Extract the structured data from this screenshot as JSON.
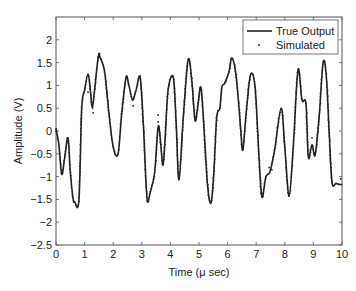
{
  "chart_data": {
    "type": "line",
    "title": "",
    "xlabel": "Time (μ sec)",
    "ylabel": "Amplitude (V)",
    "xlim": [
      0,
      10
    ],
    "ylim": [
      -2.5,
      2.5
    ],
    "xticks": [
      0,
      1,
      2,
      3,
      4,
      5,
      6,
      7,
      8,
      9,
      10
    ],
    "yticks": [
      -2.5,
      -2,
      -1.5,
      -1,
      -0.5,
      0,
      0.5,
      1,
      1.5,
      2
    ],
    "xtick_labels": [
      "0",
      "1",
      "2",
      "3",
      "4",
      "5",
      "6",
      "7",
      "8",
      "9",
      "10"
    ],
    "ytick_labels": [
      "−2.5",
      "−2",
      "−1.5",
      "−1",
      "−0.5",
      "0",
      "0.5",
      "1",
      "1.5",
      "2"
    ],
    "grid": false,
    "legend_position": "upper right",
    "legend": [
      "True Output",
      "Simulated"
    ],
    "series": [
      {
        "name": "True Output",
        "style": "solid line",
        "color": "#222222",
        "x": [
          0,
          0.1,
          0.2,
          0.3,
          0.42,
          0.5,
          0.6,
          0.65,
          0.8,
          0.9,
          1.0,
          1.12,
          1.2,
          1.27,
          1.35,
          1.48,
          1.55,
          1.7,
          1.85,
          2.0,
          2.17,
          2.3,
          2.45,
          2.55,
          2.68,
          2.8,
          2.94,
          3.05,
          3.18,
          3.29,
          3.45,
          3.57,
          3.65,
          3.74,
          3.82,
          3.92,
          4.1,
          4.2,
          4.3,
          4.45,
          4.62,
          4.75,
          4.86,
          4.95,
          5.07,
          5.2,
          5.3,
          5.42,
          5.52,
          5.62,
          5.73,
          5.8,
          5.9,
          6.05,
          6.15,
          6.3,
          6.45,
          6.53,
          6.65,
          6.8,
          6.96,
          7.1,
          7.2,
          7.34,
          7.48,
          7.65,
          7.87,
          8.0,
          8.15,
          8.3,
          8.46,
          8.6,
          8.74,
          8.82,
          8.95,
          9.06,
          9.2,
          9.34,
          9.45,
          9.55,
          9.65,
          9.8,
          10.0
        ],
        "y": [
          0.05,
          -0.3,
          -0.95,
          -0.6,
          -0.15,
          -0.9,
          -1.5,
          -1.55,
          -1.52,
          0.5,
          0.9,
          1.25,
          0.9,
          0.5,
          0.9,
          1.63,
          1.6,
          1.3,
          0.4,
          -0.35,
          -0.5,
          0.4,
          1.18,
          1.0,
          0.68,
          0.9,
          1.18,
          0.2,
          -1.45,
          -1.36,
          -0.9,
          0.09,
          -0.2,
          -0.75,
          -0.1,
          0.9,
          1.18,
          0.2,
          -1.07,
          0.3,
          1.56,
          1.1,
          0.24,
          0.5,
          0.95,
          -0.2,
          -1.2,
          -1.58,
          -0.9,
          0.3,
          0.5,
          0.96,
          1.05,
          1.3,
          1.6,
          1.2,
          0.1,
          -0.42,
          0.4,
          1.23,
          0.96,
          -0.6,
          -1.45,
          -1.0,
          -0.9,
          -0.4,
          0.5,
          -0.35,
          -1.43,
          -0.3,
          1.34,
          0.68,
          0.6,
          -0.57,
          -0.3,
          -0.53,
          0.3,
          1.5,
          1.2,
          0.0,
          -1.12,
          -1.15,
          -1.18
        ]
      },
      {
        "name": "Simulated",
        "style": "dots",
        "color": "#222222",
        "outliers": [
          {
            "x": 1.12,
            "y": 0.85
          },
          {
            "x": 1.3,
            "y": 0.4
          },
          {
            "x": 1.52,
            "y": 1.7
          },
          {
            "x": 2.7,
            "y": 0.55
          },
          {
            "x": 3.57,
            "y": 0.35
          },
          {
            "x": 3.57,
            "y": 0.2
          },
          {
            "x": 7.45,
            "y": -0.8
          },
          {
            "x": 7.55,
            "y": -0.85
          },
          {
            "x": 8.95,
            "y": -0.15
          },
          {
            "x": 9.95,
            "y": -1.05
          }
        ]
      }
    ]
  }
}
